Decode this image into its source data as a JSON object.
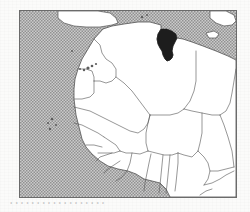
{
  "document": {
    "kind": "locator-map",
    "caption_bleed_through": "• • • • • • • • • • • • • • • • • •"
  },
  "map": {
    "title": "",
    "region_name": "Northwest Africa",
    "highlighted_country": "Tunisia",
    "frame": {
      "x": 19,
      "y": 10,
      "width": 218,
      "height": 188
    },
    "projection_box": {
      "x": 0,
      "y": 0,
      "width": 216,
      "height": 186
    }
  },
  "colors": {
    "paper": "#fbfbfa",
    "frame_border": "#6b6b6b",
    "land_fill": "#ffffff",
    "land_border": "#4a4a4a",
    "sea_fill": "#b9b9b9",
    "sea_dither_dark": "#8f8f8f",
    "highlight_fill": "#111111",
    "island_fill": "#555555"
  },
  "legend": {
    "highlight_meaning": "Highlighted country",
    "sea_meaning": "Sea / ocean",
    "land_meaning": "Land"
  },
  "features": {
    "highlight": {
      "name": "Tunisia",
      "path": "M 141,18 L 147,18 L 152,20 L 156,23 L 157,27 L 155,31 L 153,35 L 152,40 L 153,44 L 152,47 L 150,49 L 147,50 L 145,48 L 143,44 L 142,40 L 140,37 L 138,33 L 137,28 L 138,23 Z"
    },
    "land_mass": {
      "name": "Africa and southern Europe landmass",
      "path": "M 83,18 L 92,15 L 104,13 L 118,11 L 130,11 L 141,14 L 141,18 L 138,23 L 137,28 L 138,33 L 140,37 L 142,40 L 143,44 L 145,48 L 147,50 L 150,49 L 152,47 L 153,44 L 152,40 L 153,35 L 155,31 L 157,27 L 163,28 L 172,31 L 183,35 L 196,40 L 208,45 L 216,49 L 216,186 L 150,186 L 146,178 L 140,172 L 132,170 L 124,168 L 116,163 L 108,160 L 98,158 L 88,155 L 80,150 L 72,143 L 66,136 L 62,128 L 60,120 L 58,112 L 56,104 L 55,96 L 54,88 L 54,78 L 55,68 L 58,58 L 62,48 L 68,38 L 74,28 Z"
    },
    "europe": [
      {
        "name": "Iberian Peninsula",
        "path": "M 38,0 L 60,0 L 78,0 L 90,2 L 96,7 L 98,12 L 92,14 L 80,16 L 66,16 L 54,15 L 44,12 L 38,7 Z"
      },
      {
        "name": "Italy-Sicily-Malta",
        "path": "M 190,0 L 206,0 L 214,4 L 216,10 L 212,14 L 204,15 L 196,12 L 190,7 Z"
      },
      {
        "name": "Sicily",
        "path": "M 186,22 L 194,20 L 199,23 L 196,27 L 189,27 Z"
      }
    ],
    "borders": [
      {
        "name": "morocco-algeria",
        "path": "M 74,28 L 80,34 L 82,42 L 86,48 L 92,52 L 96,58 L 96,66 L 92,70 L 86,72 L 80,70 L 74,70"
      },
      {
        "name": "morocco-western-sahara",
        "path": "M 58,58 L 66,58 L 72,60 L 74,66 L 74,70"
      },
      {
        "name": "western-sahara-mauritania",
        "path": "M 54,88 L 62,88 L 70,86 L 74,82 L 74,70"
      },
      {
        "name": "algeria-mauritania-mali",
        "path": "M 96,66 L 104,72 L 112,80 L 118,88 L 124,96 L 130,104"
      },
      {
        "name": "mauritania-mali",
        "path": "M 54,96 L 62,98 L 70,100 L 78,104 L 86,108 L 94,112 L 102,116 L 110,120 L 118,122 L 124,118 L 128,112 L 130,104"
      },
      {
        "name": "mauritania-senegal",
        "path": "M 54,112 L 62,114 L 70,118 L 78,122 L 84,126"
      },
      {
        "name": "senegal-mali",
        "path": "M 84,126 L 90,130 L 96,134 L 100,140"
      },
      {
        "name": "algeria-niger",
        "path": "M 130,104 L 140,104 L 150,104 L 158,102 L 164,98"
      },
      {
        "name": "algeria-libya",
        "path": "M 164,98 L 170,90 L 174,80 L 176,70 L 176,58 L 176,48 L 176,40"
      },
      {
        "name": "libya-niger-chad",
        "path": "M 164,98 L 172,100 L 182,102 L 192,104 L 200,104"
      },
      {
        "name": "libya-egypt",
        "path": "M 200,104 L 206,100 L 210,92 L 212,82 L 214,70 L 216,58"
      },
      {
        "name": "niger-chad",
        "path": "M 182,102 L 182,112 L 182,122 L 180,132 L 178,140"
      },
      {
        "name": "niger-mali",
        "path": "M 130,104 L 128,112 L 126,122 L 126,132 L 128,140"
      },
      {
        "name": "mali-burkina",
        "path": "M 128,140 L 136,142 L 144,144 L 152,144 L 158,142"
      },
      {
        "name": "niger-nigeria",
        "path": "M 158,142 L 164,144 L 172,146 L 178,140"
      },
      {
        "name": "nigeria-chad-cameroon",
        "path": "M 178,140 L 184,146 L 188,152 L 190,160 L 188,168 L 184,174"
      },
      {
        "name": "nigeria-benin",
        "path": "M 158,142 L 158,152 L 157,162 L 156,172 L 155,180"
      },
      {
        "name": "benin-togo",
        "path": "M 150,144 L 149,154 L 148,164 L 147,174 L 146,182"
      },
      {
        "name": "togo-ghana",
        "path": "M 143,144 L 142,154 L 141,164 L 140,174 L 139,182"
      },
      {
        "name": "ghana-ivory-coast",
        "path": "M 131,143 L 129,152 L 127,162 L 125,172 L 124,180"
      },
      {
        "name": "ivory-coast-liberia-guinea",
        "path": "M 112,142 L 110,152 L 107,160 L 102,166 L 96,170"
      },
      {
        "name": "guinea-sierra-leone",
        "path": "M 100,150 L 94,154 L 88,158 L 84,162"
      },
      {
        "name": "guinea-guinea-bissau",
        "path": "M 92,142 L 86,144 L 80,146 L 76,150"
      },
      {
        "name": "senegal-gambia",
        "path": "M 66,134 L 74,134 L 82,136"
      },
      {
        "name": "senegal-guinea",
        "path": "M 78,142 L 86,142 L 94,142 L 100,140"
      },
      {
        "name": "mali-guinea-ivory",
        "path": "M 100,140 L 106,142 L 112,142 L 120,143 L 128,140"
      },
      {
        "name": "chad-car",
        "path": "M 190,160 L 198,160 L 206,158 L 214,156"
      },
      {
        "name": "chad-sudan",
        "path": "M 200,104 L 204,114 L 208,126 L 212,140 L 214,156"
      },
      {
        "name": "cameroon-car",
        "path": "M 184,174 L 192,172 L 200,168 L 206,164 L 214,160"
      },
      {
        "name": "cameroon-gabon",
        "path": "M 180,184 L 186,180 L 192,178"
      }
    ],
    "islands": [
      {
        "name": "Canary Islands",
        "cx": 68,
        "cy": 57,
        "r": 1.6
      },
      {
        "name": "Canary Islands",
        "cx": 72,
        "cy": 55,
        "r": 1.3
      },
      {
        "name": "Canary Islands",
        "cx": 64,
        "cy": 59,
        "r": 1.2
      },
      {
        "name": "Canary Islands",
        "cx": 60,
        "cy": 58,
        "r": 1.0
      },
      {
        "name": "Canary Islands",
        "cx": 76,
        "cy": 53,
        "r": 1.1
      },
      {
        "name": "Madeira",
        "cx": 52,
        "cy": 40,
        "r": 1.0
      },
      {
        "name": "Cape Verde",
        "cx": 32,
        "cy": 108,
        "r": 1.3
      },
      {
        "name": "Cape Verde",
        "cx": 28,
        "cy": 112,
        "r": 1.1
      },
      {
        "name": "Cape Verde",
        "cx": 36,
        "cy": 114,
        "r": 1.0
      },
      {
        "name": "Cape Verde",
        "cx": 30,
        "cy": 118,
        "r": 1.2
      },
      {
        "name": "Balearic Islands",
        "cx": 122,
        "cy": 6,
        "r": 1.2
      },
      {
        "name": "Balearic Islands",
        "cx": 127,
        "cy": 4,
        "r": 1.0
      }
    ]
  }
}
